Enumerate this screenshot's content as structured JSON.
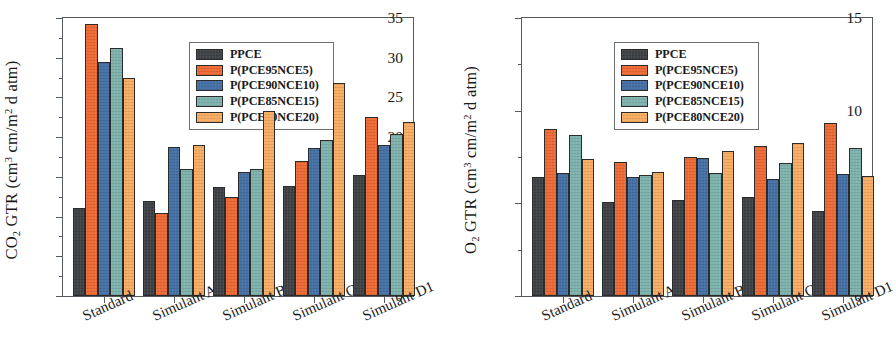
{
  "figure": {
    "panels": [
      {
        "tag": "a)",
        "ylabel_html": "CO<sub>2</sub> GTR (cm<sup>3</sup> cm/m<sup>2</sup> d atm)",
        "ylabel_text": "CO2 GTR (cm3 cm/m2 d atm)"
      },
      {
        "tag": "b)",
        "ylabel_html": "O<sub>2</sub> GTR (cm<sup>3</sup> cm/m<sup>2</sup> d atm)",
        "ylabel_text": "O2 GTR (cm3 cm/m2 d atm)"
      }
    ]
  },
  "series_colors": {
    "PPCE": "#3f4246",
    "P(PCE95NCE5)": "#ef6a34",
    "P(PCE90NCE10)": "#4571a6",
    "P(PCE85NCE15)": "#7eb3ad",
    "P(PCE80NCE20)": "#f9ad63"
  },
  "chart_data": [
    {
      "type": "bar",
      "panel": "a)",
      "title": "",
      "xlabel": "",
      "ylabel": "CO2 GTR (cm3 cm/m2 d atm)",
      "categories": [
        "Standard",
        "Simulant A",
        "Simulant B",
        "Simulant C",
        "Simulant D1"
      ],
      "series": [
        {
          "name": "PPCE",
          "color": "#3f4246",
          "values": [
            11.1,
            11.9,
            13.7,
            13.8,
            15.2
          ]
        },
        {
          "name": "P(PCE95NCE5)",
          "color": "#ef6a34",
          "values": [
            34.2,
            10.5,
            12.5,
            17.0,
            22.5
          ]
        },
        {
          "name": "P(PCE90NCE10)",
          "color": "#4571a6",
          "values": [
            29.4,
            18.8,
            15.6,
            18.6,
            19.0
          ]
        },
        {
          "name": "P(PCE85NCE15)",
          "color": "#7eb3ad",
          "values": [
            31.2,
            16.0,
            16.0,
            19.7,
            20.4
          ]
        },
        {
          "name": "P(PCE80NCE20)",
          "color": "#f9ad63",
          "values": [
            27.5,
            19.0,
            23.3,
            26.8,
            21.9
          ]
        }
      ],
      "ylim": [
        0,
        35
      ],
      "yticks": [
        0,
        5,
        10,
        15,
        20,
        25,
        30,
        35
      ],
      "ytick_labels": [
        "0",
        "5",
        "10",
        "15",
        "20",
        "25",
        "30",
        "35"
      ],
      "grid": false,
      "legend_position": "top-center"
    },
    {
      "type": "bar",
      "panel": "b)",
      "title": "",
      "xlabel": "",
      "ylabel": "O2 GTR (cm3 cm/m2 d atm)",
      "categories": [
        "Standard",
        "Simulant A",
        "Simulant B",
        "Simulant C",
        "Simulant D1"
      ],
      "series": [
        {
          "name": "PPCE",
          "color": "#3f4246",
          "values": [
            6.4,
            5.05,
            5.2,
            5.35,
            4.6
          ]
        },
        {
          "name": "P(PCE95NCE5)",
          "color": "#ef6a34",
          "values": [
            9.0,
            7.25,
            7.5,
            8.1,
            9.35
          ]
        },
        {
          "name": "P(PCE90NCE10)",
          "color": "#4571a6",
          "values": [
            6.65,
            6.4,
            7.45,
            6.3,
            6.6
          ]
        },
        {
          "name": "P(PCE85NCE15)",
          "color": "#7eb3ad",
          "values": [
            8.7,
            6.55,
            6.65,
            7.2,
            8.0
          ]
        },
        {
          "name": "P(PCE80NCE20)",
          "color": "#f9ad63",
          "values": [
            7.4,
            6.7,
            7.85,
            8.25,
            6.5
          ]
        }
      ],
      "ylim": [
        0,
        15
      ],
      "yticks": [
        0,
        5,
        10,
        15
      ],
      "ytick_labels": [
        "0",
        "5",
        "10",
        "15"
      ],
      "grid": false,
      "legend_position": "top-left"
    }
  ],
  "legend": {
    "entries": [
      "PPCE",
      "P(PCE95NCE5)",
      "P(PCE90NCE10)",
      "P(PCE85NCE15)",
      "P(PCE80NCE20)"
    ]
  }
}
